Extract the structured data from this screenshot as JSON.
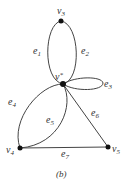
{
  "diagram": {
    "caption": "(b)",
    "vertices": [
      {
        "id": "v3",
        "label": "v",
        "sub": "3"
      },
      {
        "id": "vstar",
        "label": "v",
        "sup": "*"
      },
      {
        "id": "v4",
        "label": "v",
        "sub": "4"
      },
      {
        "id": "v5",
        "label": "v",
        "sub": "5"
      }
    ],
    "edges": [
      {
        "id": "e1",
        "label": "e",
        "sub": "1",
        "from": "v3",
        "to": "v*"
      },
      {
        "id": "e2",
        "label": "e",
        "sub": "2",
        "from": "v3",
        "to": "v*"
      },
      {
        "id": "e3",
        "label": "e",
        "sub": "3",
        "from": "v*",
        "to": "v*"
      },
      {
        "id": "e4",
        "label": "e",
        "sub": "4",
        "from": "v*",
        "to": "v4"
      },
      {
        "id": "e5",
        "label": "e",
        "sub": "5",
        "from": "v*",
        "to": "v4"
      },
      {
        "id": "e6",
        "label": "e",
        "sub": "6",
        "from": "v*",
        "to": "v5"
      },
      {
        "id": "e7",
        "label": "e",
        "sub": "7",
        "from": "v4",
        "to": "v5"
      }
    ]
  }
}
